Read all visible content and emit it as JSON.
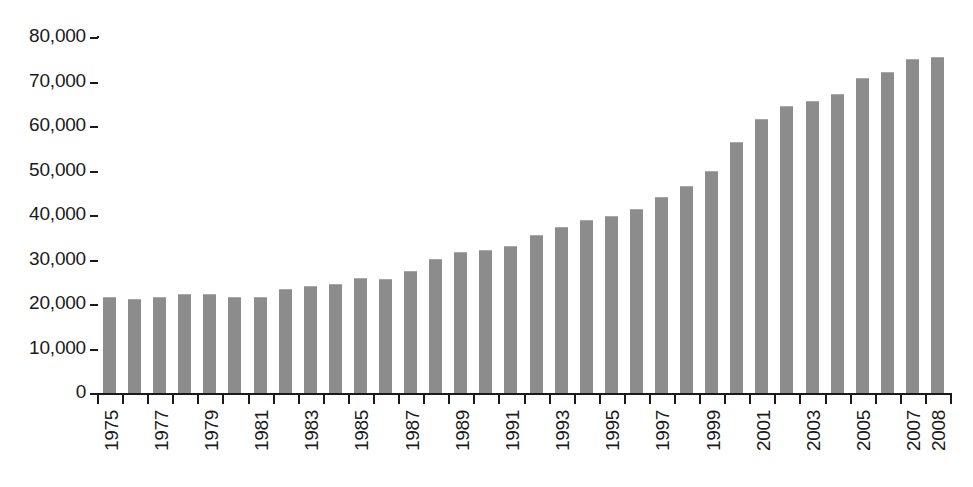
{
  "chart_data": {
    "type": "bar",
    "title": "",
    "subtitle": "",
    "xlabel": "",
    "ylabel": "",
    "categories": [
      "1975",
      "1976",
      "1977",
      "1978",
      "1979",
      "1980",
      "1981",
      "1982",
      "1983",
      "1984",
      "1985",
      "1986",
      "1987",
      "1988",
      "1989",
      "1990",
      "1991",
      "1992",
      "1993",
      "1994",
      "1995",
      "1996",
      "1997",
      "1998",
      "1999",
      "2000",
      "2001",
      "2002",
      "2003",
      "2004",
      "2005",
      "2006",
      "2007",
      "2008"
    ],
    "values": [
      21900,
      21400,
      21800,
      22500,
      22400,
      21900,
      21800,
      23700,
      24300,
      24800,
      26100,
      25900,
      27700,
      30400,
      32000,
      32400,
      33300,
      35700,
      37500,
      39200,
      40100,
      41600,
      44200,
      46800,
      50200,
      56700,
      61800,
      64800,
      65800,
      67400,
      71100,
      72400,
      75300,
      75800
    ],
    "tick_labels_x": [
      "1975",
      "1977",
      "1979",
      "1981",
      "1983",
      "1985",
      "1987",
      "1989",
      "1991",
      "1993",
      "1995",
      "1997",
      "1999",
      "2001",
      "2003",
      "2005",
      "2007",
      "2008"
    ],
    "y_ticks": [
      0,
      10000,
      20000,
      30000,
      40000,
      50000,
      60000,
      70000,
      80000
    ],
    "y_tick_labels": [
      "0",
      "10,000",
      "20,000",
      "30,000",
      "40,000",
      "50,000",
      "60,000",
      "70,000",
      "80,000"
    ],
    "ylim": [
      0,
      80000
    ],
    "grid": false,
    "legend": null,
    "legend_position": "none",
    "bar_color": "#8c8c8c",
    "axis_color": "#1a1a1a",
    "background_color": "#ffffff"
  }
}
